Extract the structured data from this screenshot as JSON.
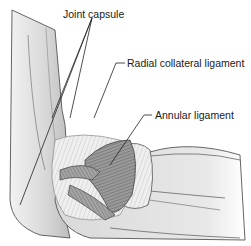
{
  "diagram": {
    "labels": [
      {
        "id": "joint-capsule",
        "text": "Joint capsule"
      },
      {
        "id": "radial-collateral-ligament",
        "text": "Radial collateral ligament"
      },
      {
        "id": "annular-ligament",
        "text": "Annular ligament"
      }
    ],
    "colors": {
      "background": "#ffffff",
      "bone_light": "#e6e6e6",
      "bone_mid": "#cfcfcf",
      "ligament": "#8a8a8a",
      "ligament_dark": "#5e5e5e",
      "outline": "#555555",
      "leader": "#222222"
    }
  }
}
